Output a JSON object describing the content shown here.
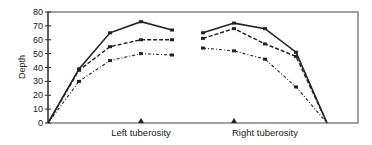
{
  "chart_data": {
    "type": "line",
    "title": "",
    "xlabel": "",
    "ylabel": "Depth",
    "ylim": [
      0,
      80
    ],
    "yticks": [
      0,
      10,
      20,
      30,
      40,
      50,
      60,
      70,
      80
    ],
    "grid": false,
    "legend": null,
    "category_labels": [
      "Left tuberosity",
      "Right tuberosity"
    ],
    "x_positions": [
      0,
      1,
      2,
      3,
      4,
      5,
      6,
      7,
      8,
      9,
      10
    ],
    "segments": [
      {
        "name": "Left tuberosity",
        "x": [
          0,
          1,
          2,
          3,
          4
        ]
      },
      {
        "name": "Right tuberosity",
        "x": [
          5,
          6,
          7,
          8,
          9,
          10
        ]
      }
    ],
    "series": [
      {
        "name": "Series 1 (solid)",
        "style": "solid",
        "left": [
          0,
          39,
          65,
          73,
          67
        ],
        "right": [
          65,
          72,
          68,
          51,
          0
        ]
      },
      {
        "name": "Series 2 (dashed)",
        "style": "dashed",
        "left": [
          0,
          38,
          55,
          60,
          60
        ],
        "right": [
          61,
          68,
          57,
          48,
          0
        ]
      },
      {
        "name": "Series 3 (dash-dot)",
        "style": "dash-dot",
        "left": [
          0,
          30,
          45,
          50,
          49
        ],
        "right": [
          54,
          52,
          46,
          26,
          0
        ]
      }
    ],
    "markers": [
      {
        "label": "Left tuberosity",
        "x": 3,
        "y": 0,
        "shape": "triangle"
      },
      {
        "label": "Right tuberosity",
        "x": 6,
        "y": 0,
        "shape": "triangle"
      }
    ]
  }
}
